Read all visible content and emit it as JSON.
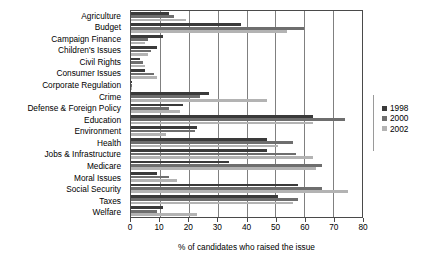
{
  "chart_data": {
    "type": "bar",
    "orientation": "horizontal",
    "title": "",
    "xlabel": "% of candidates who raised the issue",
    "ylabel": "",
    "xlim": [
      0,
      80
    ],
    "xticks": [
      0,
      10,
      20,
      30,
      40,
      50,
      60,
      70,
      80
    ],
    "grid": true,
    "legend_position": "right",
    "categories": [
      "Agriculture",
      "Budget",
      "Campaign Finance",
      "Children's Issues",
      "Civil Rights",
      "Consumer Issues",
      "Corporate Regulation",
      "Crime",
      "Defense & Foreign Policy",
      "Education",
      "Environment",
      "Health",
      "Jobs & Infrastructure",
      "Medicare",
      "Moral Issues",
      "Social Security",
      "Taxes",
      "Welfare"
    ],
    "series": [
      {
        "name": "1998",
        "color": "#3a3a3a",
        "values": [
          13,
          38,
          11,
          9,
          3,
          5,
          0,
          27,
          18,
          63,
          23,
          47,
          47,
          34,
          9,
          58,
          51,
          11
        ]
      },
      {
        "name": "2000",
        "color": "#6e6e6e",
        "values": [
          15,
          60,
          6,
          7,
          4,
          8,
          0,
          24,
          13,
          74,
          22,
          56,
          57,
          66,
          13,
          66,
          58,
          9
        ]
      },
      {
        "name": "2002",
        "color": "#b3b3b3",
        "values": [
          19,
          54,
          5,
          6,
          5,
          9,
          0,
          47,
          17,
          63,
          12,
          51,
          63,
          64,
          16,
          75,
          56,
          23
        ]
      }
    ]
  },
  "legend": {
    "items": [
      {
        "label": "1998",
        "color": "#3a3a3a"
      },
      {
        "label": "2000",
        "color": "#6e6e6e"
      },
      {
        "label": "2002",
        "color": "#b3b3b3"
      }
    ]
  },
  "axis": {
    "x_title": "% of candidates who raised the issue",
    "tick_labels": [
      "0",
      "10",
      "20",
      "30",
      "40",
      "50",
      "60",
      "70",
      "80"
    ]
  }
}
